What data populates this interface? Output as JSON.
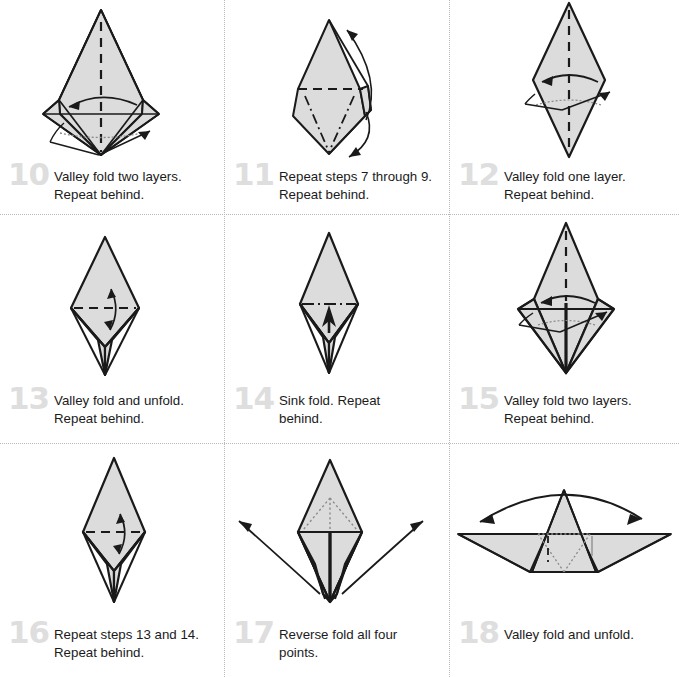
{
  "document": {
    "kind": "origami-instruction-sheet",
    "page_width": 679,
    "page_height": 677,
    "columns": 3,
    "rows": 3,
    "paper_fill": "#dcdcdc",
    "line_color": "#1a1a1a",
    "step_number_color": "#dedede",
    "caption_color": "#1b1b1b",
    "divider_color": "#b9b9b9"
  },
  "steps": [
    {
      "number": "10",
      "caption": "Valley fold two layers.\nRepeat behind.",
      "figure": "kite-wide-shoulders-valley-two-layers",
      "marks": [
        "vertical-dashed-center-crease",
        "curved-arrow-left",
        "small-arrows-lower-sides",
        "dotted-hidden-edge"
      ]
    },
    {
      "number": "11",
      "caption": "Repeat steps 7 through 9.\nRepeat behind.",
      "figure": "kite-with-dash-dot-vee",
      "marks": [
        "horizontal-dashed-crease",
        "dash-dot-vee-crease",
        "long-repeat-arrow-up",
        "long-repeat-arrow-down"
      ]
    },
    {
      "number": "12",
      "caption": "Valley fold one layer.\nRepeat behind.",
      "figure": "tall-narrow-diamond",
      "marks": [
        "vertical-dashed-center-crease",
        "curved-arrow-left",
        "small-arrows-sides",
        "dotted-hidden-edge"
      ]
    },
    {
      "number": "13",
      "caption": "Valley fold and unfold.\nRepeat behind.",
      "figure": "diamond-with-lower-stem",
      "marks": [
        "horizontal-dashed-crease",
        "double-headed-arrow-vertical"
      ]
    },
    {
      "number": "14",
      "caption": "Sink fold. Repeat\nbehind.",
      "figure": "diamond-with-lower-stem",
      "marks": [
        "horizontal-dash-dot-crease",
        "solid-sink-arrow-up"
      ]
    },
    {
      "number": "15",
      "caption": "Valley fold two layers.\nRepeat behind.",
      "figure": "diamond-with-center-spine",
      "marks": [
        "vertical-dashed-center-crease",
        "curved-arrow-left",
        "small-arrows-sides",
        "dotted-hidden-edge"
      ]
    },
    {
      "number": "16",
      "caption": "Repeat steps 13 and 14.\nRepeat behind.",
      "figure": "diamond-with-lower-stem",
      "marks": [
        "horizontal-dashed-crease",
        "double-headed-arrow-vertical"
      ]
    },
    {
      "number": "17",
      "caption": "Reverse fold all four\npoints.",
      "figure": "diamond-with-four-points",
      "marks": [
        "dotted-hidden-vee",
        "wide-curved-arrow-left",
        "wide-curved-arrow-right",
        "center-spine"
      ]
    },
    {
      "number": "18",
      "caption": "Valley fold and unfold.",
      "figure": "wide-flat-boat-with-peak",
      "marks": [
        "wide-double-curved-arrow",
        "dotted-hidden-lines",
        "short-dashed-crease"
      ]
    }
  ]
}
